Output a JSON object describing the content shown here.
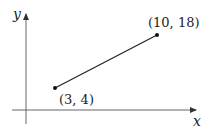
{
  "diagram": {
    "type": "line-segment-on-axes",
    "axes": {
      "x_label": "x",
      "y_label": "y"
    },
    "points": [
      {
        "label": "(3, 4)",
        "x": 3,
        "y": 4
      },
      {
        "label": "(10, 18)",
        "x": 10,
        "y": 18
      }
    ],
    "colors": {
      "line": "#222222",
      "axis": "#555555"
    }
  }
}
